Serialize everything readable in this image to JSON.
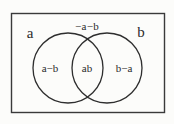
{
  "figure": {
    "background_color": "#fcfcfa",
    "ink_color": "#2b2b2b"
  },
  "universe_box": {
    "name": "universal-set-rectangle",
    "x": 11,
    "y": 13,
    "width": 154,
    "height": 100
  },
  "sets": [
    {
      "id": "set-a",
      "outer_label": "a",
      "outer_label_x": 30,
      "outer_label_y": 33,
      "circle": {
        "cx": 68,
        "cy": 68,
        "r": 35
      }
    },
    {
      "id": "set-b",
      "outer_label": "b",
      "outer_label_x": 141,
      "outer_label_y": 32,
      "circle": {
        "cx": 107,
        "cy": 68,
        "r": 35
      }
    }
  ],
  "regions": [
    {
      "id": "region-a-only",
      "label": "a−b",
      "x": 50,
      "y": 68
    },
    {
      "id": "region-intersection",
      "label": "ab",
      "x": 87,
      "y": 68
    },
    {
      "id": "region-b-only",
      "label": "b−a",
      "x": 124,
      "y": 68
    },
    {
      "id": "region-complement",
      "label": "−a−b",
      "x": 87,
      "y": 26
    }
  ],
  "chart_data": {
    "type": "diagram",
    "diagram_kind": "venn",
    "title": "",
    "set_labels": [
      "a",
      "b"
    ],
    "region_labels": {
      "a_only": "a−b",
      "intersection": "ab",
      "b_only": "b−a",
      "outside": "−a−b"
    }
  }
}
